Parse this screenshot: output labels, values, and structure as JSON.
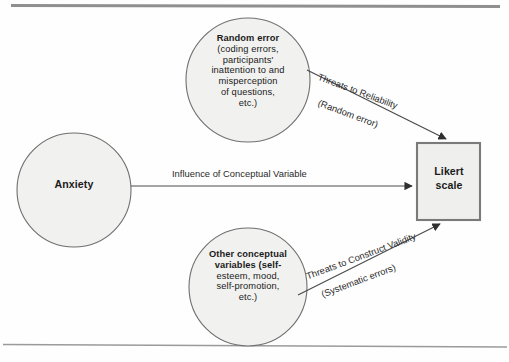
{
  "figure": {
    "colors": {
      "node_fill": "#f1f1ef",
      "node_stroke": "#6f6f6f",
      "box_fill": "#efefed",
      "box_stroke": "#7a7a7a",
      "edge_stroke": "#4a4a4a",
      "rule_stroke": "#8f8f8f",
      "text": "#1b1b1b"
    }
  },
  "rules": {
    "top_rule": "horizontal-rule",
    "bottom_rule": "horizontal-rule"
  },
  "nodes": {
    "random_error": {
      "name": "Random error",
      "detail_lines": [
        "(coding errors,",
        "participants'",
        "inattention to and",
        "misperception",
        "of questions,",
        "etc.)"
      ],
      "shape": "circle"
    },
    "other_conceptual": {
      "name_lines": [
        "Other conceptual",
        "variables (self-"
      ],
      "detail_lines": [
        "esteem, mood,",
        "self-promotion,",
        "etc.)"
      ],
      "shape": "circle"
    },
    "anxiety": {
      "name": "Anxiety",
      "shape": "circle"
    },
    "likert": {
      "name_lines": [
        "Likert",
        "scale"
      ],
      "shape": "rectangle"
    }
  },
  "edges": {
    "influence": {
      "label": "Influence of Conceptual Variable",
      "from": "anxiety",
      "to": "likert",
      "direction": "right"
    },
    "reliability": {
      "label_line_1": "Threats to Reliability",
      "label_line_2": "(Random error)",
      "from": "random_error",
      "to": "likert",
      "direction": "down-right"
    },
    "construct_validity": {
      "label_line_1": "Threats to Construct Validity",
      "label_line_2": "(Systematic errors)",
      "from": "other_conceptual",
      "to": "likert",
      "direction": "up-right"
    }
  }
}
